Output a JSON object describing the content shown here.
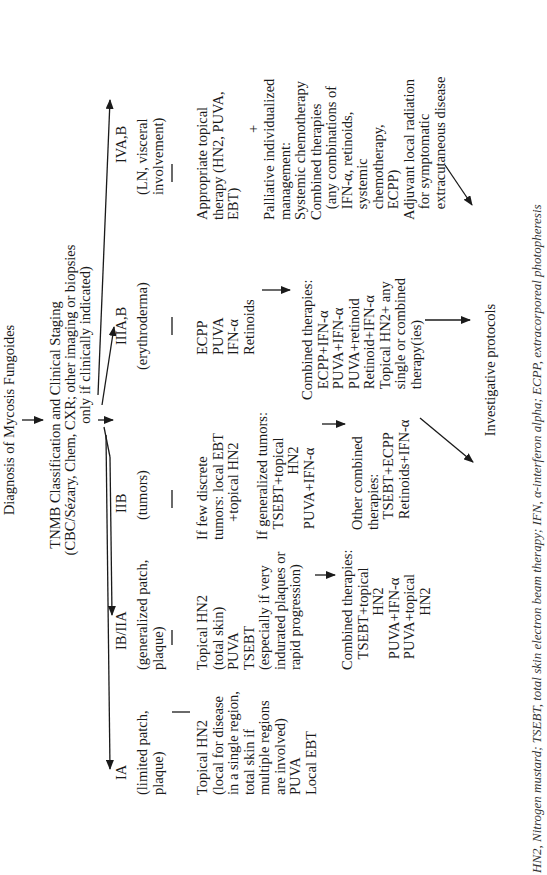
{
  "diagram": {
    "title": "Diagnosis of Mycosis Fungoides",
    "staging": {
      "line1": "TNMB Classification and Clinical Staging",
      "line2": "(CBC/Sézary, Chem, CXR; other imaging or biopsies",
      "line3": "only if clinically indicated)"
    },
    "stages": [
      {
        "id": "IA",
        "label": "IA",
        "description": "(limited patch,\nplaque)",
        "first_line": "Topical HN2\n(local for disease\nin a single region,\ntotal skin if\nmultiple regions\nare involved)\nPUVA\nLocal EBT"
      },
      {
        "id": "IB-IIA",
        "label": "IB/IIA",
        "description": "(generalized patch,\nplaque)",
        "first_line": "Topical HN2\n(total skin)\nPUVA\nTSEBT\n(especially if very\nindurated plaques or\nrapid progression)",
        "combined": "Combined therapies:\n   TSEBT+topical\n               HN2\n   PUVA+IFN-α\n   PUVA+topical\n               HN2"
      },
      {
        "id": "IIB",
        "label": "IIB",
        "description": "(tumors)",
        "first_line": "If few discrete\ntumors: local EBT\n     +topical HN2",
        "generalized": "If generalized tumors:\n   TSEBT+topical\n                  HN2\n   PUVA+IFN-α",
        "combined": "Other combined\ntherapies:\n   TSEBT+ECPP\n   Retinoids+IFN-α"
      },
      {
        "id": "IIIA-B",
        "label": "IIIA,B",
        "description": "(erythroderma)",
        "first_line": "ECPP\nPUVA\nIFN-α\nRetinoids",
        "combined": "Combined therapies:\n   ECPP+IFN-α\n   PUVA+IFN-α\n   PUVA+retinoid\n   Retinoid+IFN-α\n   Topical HN2+ any\n   single or combined\n   therapy(ies)"
      },
      {
        "id": "IVA-B",
        "label": "IVA,B",
        "description": "(LN, visceral\ninvolvement)",
        "first_line": "Appropriate topical\ntherapy (HN2, PUVA,\nEBT)",
        "plus": "+",
        "palliative": "Palliative individualized\nmanagement:\nSystemic chemotherapy\nCombined therapies\n   (any combinations of\n   IFN-α, retinoids,\n   systemic\n   chemotherapy,\n   ECPP)\nAdjuvant local radiation\n   for symptomatic\n   extracutaneous disease"
      }
    ],
    "outcome": "Investigative protocols",
    "footnote": "HN2, Nitrogen mustard; TSEBT, total skin electron beam therapy; IFN, α-interferon alpha; ECPP, extracorporeal photopheresis"
  }
}
